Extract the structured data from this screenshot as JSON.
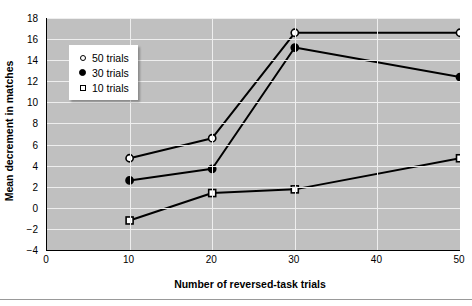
{
  "chart_data": {
    "type": "line",
    "title": "",
    "xlabel": "Number of reversed-task trials",
    "ylabel": "Mean decrement in matches",
    "x": [
      10,
      20,
      30,
      50
    ],
    "xlim": [
      0,
      50
    ],
    "ylim": [
      -4,
      18
    ],
    "xticks": [
      0,
      10,
      20,
      30,
      40,
      50
    ],
    "yticks": [
      -4,
      -2,
      0,
      2,
      4,
      6,
      8,
      10,
      12,
      14,
      16,
      18
    ],
    "grid": true,
    "legend_position": "upper-left-inside",
    "series": [
      {
        "name": "50 trials",
        "marker": "open-circle",
        "values": [
          4.7,
          6.6,
          16.6,
          16.6
        ]
      },
      {
        "name": "30 trials",
        "marker": "filled-circle",
        "values": [
          2.6,
          3.7,
          15.2,
          12.4
        ]
      },
      {
        "name": "10 trials",
        "marker": "open-square",
        "values": [
          -1.2,
          1.4,
          1.75,
          4.7
        ]
      }
    ]
  },
  "axes": {
    "ytick_labels": [
      "18",
      "16",
      "14",
      "12",
      "10",
      "8",
      "6",
      "4",
      "2",
      "0",
      "-2",
      "-4"
    ],
    "xtick_labels": [
      "0",
      "10",
      "20",
      "30",
      "40",
      "50"
    ]
  },
  "legend": {
    "items": [
      {
        "label": "50 trials",
        "marker": "open-circle"
      },
      {
        "label": "30 trials",
        "marker": "filled-circle"
      },
      {
        "label": "10 trials",
        "marker": "open-square"
      }
    ]
  },
  "colors": {
    "plot_background": "#c0c0c0",
    "gridline": "#eeeeee",
    "series_line": "#000000",
    "axis": "#000000",
    "page_background": "#ffffff"
  }
}
